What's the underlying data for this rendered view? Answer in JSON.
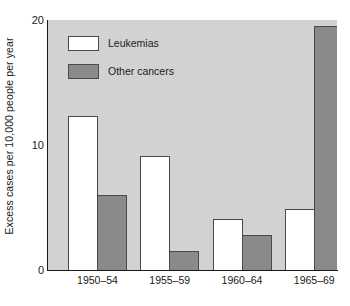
{
  "chart_data": {
    "type": "bar",
    "title": "",
    "xlabel": "",
    "ylabel": "Excess cases per 10,000 people per year",
    "categories": [
      "1950–54",
      "1955–59",
      "1960–64",
      "1965–69"
    ],
    "series": [
      {
        "name": "Leukemias",
        "color": "#ffffff",
        "values": [
          12.3,
          9.1,
          4.1,
          4.9
        ]
      },
      {
        "name": "Other cancers",
        "color": "#8a8a8a",
        "values": [
          6.0,
          1.5,
          2.8,
          19.5
        ]
      }
    ],
    "ylim": [
      0,
      20
    ],
    "yticks": [
      "0",
      "10",
      "20"
    ],
    "ytick_values": [
      0,
      10,
      20
    ],
    "grid": false,
    "legend_position": "upper-left-inside",
    "panel_color": "#d2d2d2",
    "axis_color": "#1a1a1a",
    "bar_edge_color": "#4a4a4a"
  },
  "legend": {
    "items": [
      {
        "label": "Leukemias",
        "swatch": "white"
      },
      {
        "label": "Other cancers",
        "swatch": "gray"
      }
    ]
  }
}
